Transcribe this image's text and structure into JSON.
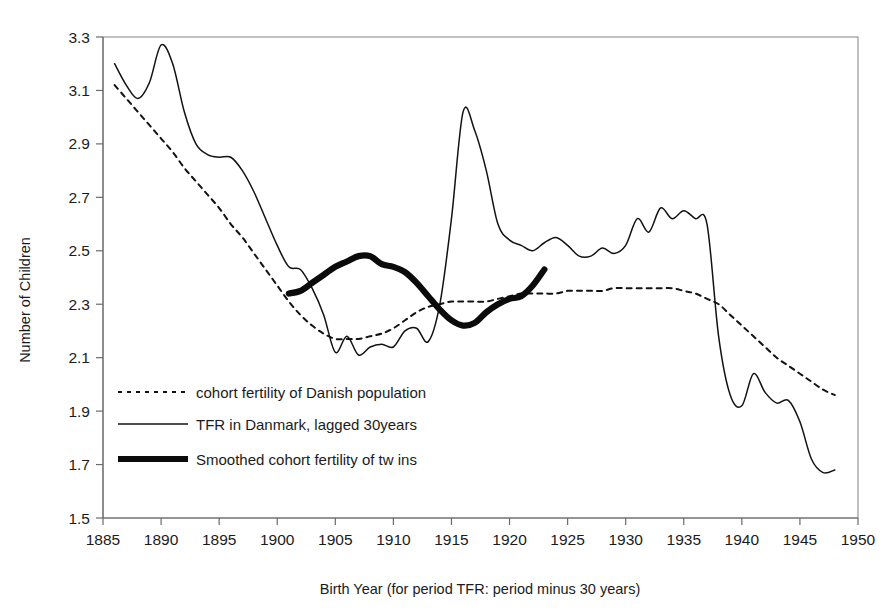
{
  "chart_data": {
    "type": "line",
    "title": "",
    "xlabel": "Birth Year (for period TFR: period minus 30 years)",
    "ylabel": "Number of Children",
    "xlim": [
      1885,
      1950
    ],
    "ylim": [
      1.5,
      3.3
    ],
    "xticks": [
      1885,
      1890,
      1895,
      1900,
      1905,
      1910,
      1915,
      1920,
      1925,
      1930,
      1935,
      1940,
      1945,
      1950
    ],
    "yticks": [
      1.5,
      1.7,
      1.9,
      2.1,
      2.3,
      2.5,
      2.7,
      2.9,
      3.1,
      3.3
    ],
    "grid": false,
    "legend_position": "inside-lower-left",
    "series": [
      {
        "name": "cohort fertility of Danish population",
        "style": "dotted",
        "x": [
          1886,
          1887,
          1888,
          1889,
          1890,
          1891,
          1892,
          1893,
          1894,
          1895,
          1896,
          1897,
          1898,
          1899,
          1900,
          1901,
          1902,
          1903,
          1904,
          1905,
          1906,
          1907,
          1908,
          1909,
          1910,
          1911,
          1912,
          1913,
          1914,
          1915,
          1916,
          1917,
          1918,
          1919,
          1920,
          1921,
          1922,
          1923,
          1924,
          1925,
          1926,
          1927,
          1928,
          1929,
          1930,
          1931,
          1932,
          1933,
          1934,
          1935,
          1936,
          1937,
          1938,
          1939,
          1940,
          1941,
          1942,
          1943,
          1944,
          1945,
          1946,
          1947,
          1948
        ],
        "y": [
          3.12,
          3.07,
          3.02,
          2.97,
          2.92,
          2.87,
          2.81,
          2.76,
          2.71,
          2.66,
          2.6,
          2.55,
          2.49,
          2.43,
          2.37,
          2.31,
          2.26,
          2.22,
          2.19,
          2.17,
          2.17,
          2.17,
          2.18,
          2.19,
          2.21,
          2.24,
          2.27,
          2.29,
          2.3,
          2.31,
          2.31,
          2.31,
          2.31,
          2.32,
          2.33,
          2.34,
          2.34,
          2.34,
          2.34,
          2.35,
          2.35,
          2.35,
          2.35,
          2.36,
          2.36,
          2.36,
          2.36,
          2.36,
          2.36,
          2.35,
          2.34,
          2.32,
          2.3,
          2.26,
          2.22,
          2.18,
          2.14,
          2.1,
          2.07,
          2.04,
          2.01,
          1.98,
          1.96
        ]
      },
      {
        "name": "TFR in Danmark, lagged 30years",
        "style": "solid",
        "x": [
          1886,
          1887,
          1888,
          1889,
          1890,
          1891,
          1892,
          1893,
          1894,
          1895,
          1896,
          1897,
          1898,
          1899,
          1900,
          1901,
          1902,
          1903,
          1904,
          1905,
          1906,
          1907,
          1908,
          1909,
          1910,
          1911,
          1912,
          1913,
          1914,
          1915,
          1916,
          1917,
          1918,
          1919,
          1920,
          1921,
          1922,
          1923,
          1924,
          1925,
          1926,
          1927,
          1928,
          1929,
          1930,
          1931,
          1932,
          1933,
          1934,
          1935,
          1936,
          1937,
          1938,
          1939,
          1940,
          1941,
          1942,
          1943,
          1944,
          1945,
          1946,
          1947,
          1948
        ],
        "y": [
          3.2,
          3.12,
          3.07,
          3.13,
          3.27,
          3.2,
          3.02,
          2.9,
          2.86,
          2.85,
          2.85,
          2.8,
          2.72,
          2.62,
          2.52,
          2.44,
          2.43,
          2.36,
          2.26,
          2.12,
          2.18,
          2.11,
          2.14,
          2.15,
          2.14,
          2.2,
          2.21,
          2.16,
          2.3,
          2.62,
          3.02,
          2.95,
          2.8,
          2.6,
          2.54,
          2.52,
          2.5,
          2.53,
          2.55,
          2.52,
          2.48,
          2.48,
          2.51,
          2.49,
          2.52,
          2.62,
          2.57,
          2.66,
          2.62,
          2.65,
          2.62,
          2.6,
          2.18,
          1.96,
          1.92,
          2.04,
          1.97,
          1.93,
          1.94,
          1.86,
          1.72,
          1.67,
          1.68
        ]
      },
      {
        "name": "Smoothed cohort fertility of tw ins",
        "style": "bold",
        "x": [
          1901,
          1902,
          1903,
          1904,
          1905,
          1906,
          1907,
          1908,
          1909,
          1910,
          1911,
          1912,
          1913,
          1914,
          1915,
          1916,
          1917,
          1918,
          1919,
          1920,
          1921,
          1922,
          1923
        ],
        "y": [
          2.34,
          2.35,
          2.38,
          2.41,
          2.44,
          2.46,
          2.48,
          2.48,
          2.45,
          2.44,
          2.42,
          2.38,
          2.33,
          2.28,
          2.24,
          2.22,
          2.23,
          2.27,
          2.3,
          2.32,
          2.33,
          2.37,
          2.43
        ]
      }
    ]
  },
  "legend": {
    "items": [
      {
        "label": "cohort fertility of Danish population",
        "style": "dotted"
      },
      {
        "label": "TFR in Danmark, lagged 30years",
        "style": "solid"
      },
      {
        "label": "Smoothed cohort fertility of tw ins",
        "style": "bold"
      }
    ]
  },
  "axes": {
    "y_title": "Number of Children",
    "x_title": "Birth Year (for period TFR: period minus 30 years)"
  },
  "colors": {
    "line": "#121212",
    "frame": "#8d8d8d",
    "background": "#ffffff"
  }
}
